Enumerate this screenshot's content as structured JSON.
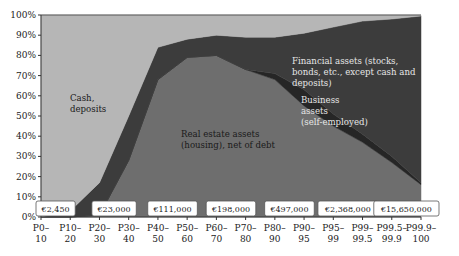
{
  "chart_data": {
    "type": "area",
    "stacked": true,
    "normalized": true,
    "title": "",
    "xlabel": "",
    "ylabel": "",
    "ylim": [
      0,
      100
    ],
    "y_ticks": [
      "0%",
      "10%",
      "20%",
      "30%",
      "40%",
      "50%",
      "60%",
      "70%",
      "80%",
      "90%",
      "100%"
    ],
    "categories": [
      "P0–10",
      "P10–20",
      "P20–30",
      "P30–40",
      "P40–50",
      "P50–60",
      "P60–70",
      "P70–80",
      "P80–90",
      "P90–95",
      "P95–99",
      "P99–99.5",
      "P99.5–99.9",
      "P99.9–100"
    ],
    "category_lines": [
      [
        "P0–",
        "10"
      ],
      [
        "P10–",
        "20"
      ],
      [
        "P20–",
        "30"
      ],
      [
        "P30–",
        "40"
      ],
      [
        "P40–",
        "50"
      ],
      [
        "P50–",
        "60"
      ],
      [
        "P60–",
        "70"
      ],
      [
        "P70–",
        "80"
      ],
      [
        "P80–",
        "90"
      ],
      [
        "P90–",
        "95"
      ],
      [
        "P95–",
        "99"
      ],
      [
        "P99–",
        "99.5"
      ],
      [
        "P99.5–",
        "99.9"
      ],
      [
        "P99.9–",
        "100"
      ]
    ],
    "series": [
      {
        "name": "Real estate assets (housing), net of debt",
        "color": "#6e6e6e",
        "values": [
          0,
          0,
          1,
          28,
          68,
          79,
          80,
          73,
          68,
          55,
          45,
          37,
          27,
          16
        ]
      },
      {
        "name": "Business assets (self-employed)",
        "color": "#262626",
        "values": [
          0,
          0,
          0,
          0,
          0,
          0,
          0,
          0,
          3,
          8,
          6,
          4,
          3,
          1
        ]
      },
      {
        "name": "Financial assets (stocks, bonds, etc., except cash and deposits)",
        "color": "#3c3c3c",
        "values": [
          0,
          3,
          16,
          22,
          16,
          9,
          10,
          16,
          18,
          28,
          43,
          56,
          68,
          82.5
        ]
      },
      {
        "name": "Cash, deposits",
        "color": "#b6b6b6",
        "values": [
          100,
          97,
          83,
          50,
          16,
          12,
          10,
          11,
          11,
          9,
          6,
          3,
          2,
          0.5
        ]
      }
    ],
    "cumulative_top_of_real_estate": [
      0,
      0,
      1,
      28,
      68,
      79,
      80,
      73,
      68,
      55,
      45,
      37,
      27,
      16
    ],
    "cumulative_top_of_business": [
      0,
      0,
      1,
      28,
      68,
      79,
      80,
      73,
      71,
      63,
      51,
      41,
      30,
      17
    ],
    "cumulative_top_of_financial": [
      0,
      3,
      17,
      50,
      84,
      88,
      90,
      89,
      89,
      91,
      94,
      97,
      98,
      99.5
    ],
    "area_labels": {
      "cash": [
        "Cash,",
        "deposits"
      ],
      "financial": [
        "Financial assets (stocks,",
        "bonds, etc., except cash and",
        "deposits)"
      ],
      "business": [
        "Business",
        "assets",
        "(self-employed)"
      ],
      "real_estate": [
        "Real estate assets",
        "(housing), net of debt"
      ]
    },
    "wealth_annotations": [
      {
        "between": "P0–10 / P10–20",
        "label": "€2,450"
      },
      {
        "between": "P20–30 / P30–40",
        "label": "€23,000"
      },
      {
        "between": "P40–50 / P50–60",
        "label": "€111,000"
      },
      {
        "between": "P60–70 / P70–80",
        "label": "€198,000"
      },
      {
        "between": "P80–90 / P90–95",
        "label": "€497,000"
      },
      {
        "between": "P95–99 / P99–99.5",
        "label": "€2,368,000"
      },
      {
        "between": "P99.5–99.9 / P99.9–100",
        "label": "€15,650,000"
      }
    ],
    "grid": false,
    "legend": "inline labels"
  }
}
